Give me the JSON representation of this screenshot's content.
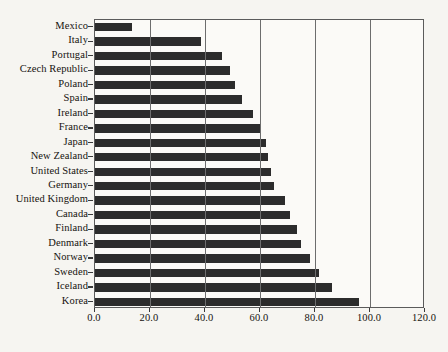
{
  "chart_data": {
    "type": "bar",
    "orientation": "horizontal",
    "title": "",
    "xlabel": "",
    "ylabel": "",
    "xlim": [
      0,
      120
    ],
    "ylim": null,
    "grid": true,
    "legend": null,
    "legend_position": "none",
    "bar_color": "#2c2c2c",
    "background_color": "#f6f5f1",
    "plot_background_color": "#fbfaf7",
    "axis_color": "#5b5b5b",
    "xticks": [
      0,
      20,
      40,
      60,
      80,
      100,
      120
    ],
    "xticklabels": [
      "0.0",
      "20.0",
      "40.0",
      "60.0",
      "80.0",
      "100.0",
      "120.0"
    ],
    "categories": [
      "Mexico",
      "Italy",
      "Portugal",
      "Czech Republic",
      "Poland",
      "Spain",
      "Ireland",
      "France",
      "Japan",
      "New Zealand",
      "United States",
      "Germany",
      "United Kingdom",
      "Canada",
      "Finland",
      "Denmark",
      "Norway",
      "Sweden",
      "Iceland",
      "Korea"
    ],
    "values": [
      13.5,
      38.5,
      46.0,
      49.0,
      51.0,
      53.5,
      57.5,
      60.0,
      62.0,
      63.0,
      64.0,
      65.0,
      69.0,
      71.0,
      73.5,
      75.0,
      78.0,
      81.5,
      86.0,
      96.0
    ]
  }
}
